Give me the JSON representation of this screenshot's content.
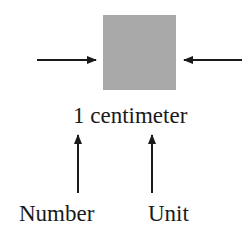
{
  "diagram": {
    "shape": "gray-square",
    "shape_color": "#a9a9a9",
    "measurement": "1 centimeter",
    "labels": {
      "number": "Number",
      "unit": "Unit"
    },
    "arrow_color": "#1a1a1a"
  }
}
